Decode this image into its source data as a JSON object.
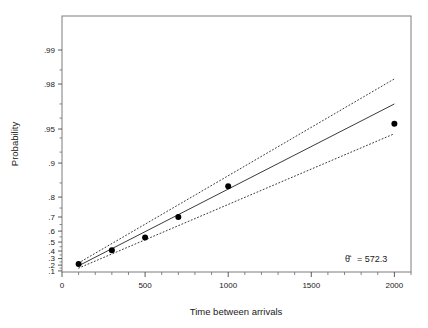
{
  "chart_data": {
    "type": "scatter",
    "title": "",
    "xlabel": "Time between arrivals",
    "ylabel": "Probability",
    "x": [
      100,
      300,
      500,
      700,
      1000,
      2000
    ],
    "values": [
      0.22,
      0.41,
      0.545,
      0.7,
      0.84,
      0.955
    ],
    "series": [
      {
        "name": "Sample data points",
        "x": [
          100,
          300,
          500,
          700,
          1000,
          2000
        ],
        "values": [
          0.22,
          0.41,
          0.545,
          0.7,
          0.84,
          0.955
        ]
      },
      {
        "name": "Fitted exponential line",
        "x": [
          100,
          2000
        ],
        "values": [
          0.19,
          0.97
        ]
      },
      {
        "name": "Upper confidence band",
        "x": [
          100,
          2000
        ],
        "values": [
          0.235,
          0.982
        ]
      },
      {
        "name": "Lower confidence band",
        "x": [
          100,
          2000
        ],
        "values": [
          0.15,
          0.945
        ]
      }
    ],
    "xlim": [
      0,
      2100
    ],
    "ylim": [
      0.08,
      0.995
    ],
    "y_scale": "exponential probability",
    "y_transform": "-ln(1-p)",
    "xticks": [
      0,
      500,
      1000,
      1500,
      2000
    ],
    "xtick_labels": [
      "0",
      "500",
      "1000",
      "1500",
      "2000"
    ],
    "x_minor_tick_step": 100,
    "yticks": [
      0.1,
      0.2,
      0.3,
      0.4,
      0.5,
      0.6,
      0.7,
      0.8,
      0.9,
      0.95,
      0.98,
      0.99
    ],
    "ytick_labels": [
      ".1",
      ".2",
      ".3",
      ".4",
      ".5",
      ".6",
      ".7",
      ".8",
      ".9",
      ".95",
      ".98",
      ".99"
    ],
    "grid": false,
    "legend": "none",
    "annotations": [
      {
        "name": "theta-hat-estimate",
        "symbol": "θ̂",
        "equals": "=",
        "value": "572.3",
        "text": "θ̂ = 572.3"
      }
    ],
    "colors": {
      "point": "#000000",
      "fit_line": "#3a3a3a",
      "confidence_band": "#3a3a3a",
      "frame": "#7d7d7d",
      "text": "#1a1a1a",
      "background": "#ffffff"
    }
  },
  "axes": {
    "x_title": "Time between arrivals",
    "y_title": "Probability"
  }
}
